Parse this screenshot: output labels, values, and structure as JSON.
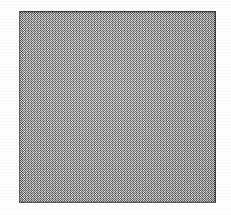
{
  "figure": {
    "title": "",
    "caption": "",
    "label": "",
    "content_text": ""
  },
  "canvas": {
    "width": 231,
    "height": 215,
    "background_color": "#ffffff"
  },
  "plate": {
    "x": 19,
    "y": 11,
    "width": 197,
    "height": 192,
    "fill_color": "#a9a9a9",
    "fill_style": "halftone-dither",
    "border_width": 1,
    "border_color_top": "#3c3c3c",
    "border_color_right": "#3f3f3f",
    "border_color_bottom": "#585858",
    "border_color_left": "#636363",
    "inner_text": ""
  },
  "margins": {
    "grain_opacity": 0.3,
    "color": "#ffffff"
  }
}
